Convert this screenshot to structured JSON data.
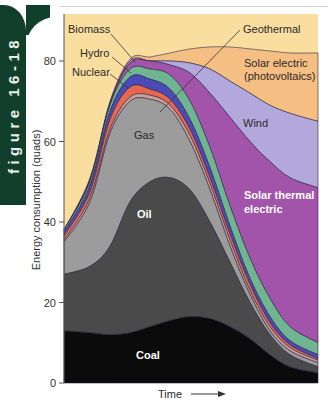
{
  "figure": {
    "tab_label": "figure 16-18"
  },
  "chart_data": {
    "type": "area",
    "title": "",
    "xlabel": "Time",
    "ylabel": "Energy consumption (quads)",
    "ylim": [
      0,
      90
    ],
    "yticks": [
      0,
      20,
      40,
      60,
      80
    ],
    "grid": false,
    "legend_position": "inline labels",
    "x": [
      0,
      1,
      2,
      3,
      4,
      5,
      6,
      7,
      8,
      9,
      10,
      11,
      12
    ],
    "stack_order_bottom_to_top": [
      "Coal",
      "Oil",
      "Gas",
      "Other (thin)",
      "Nuclear",
      "Hydro",
      "Biomass",
      "Solar thermal electric",
      "Wind",
      "Solar electric (photovoltaics)",
      "Geothermal"
    ],
    "series": [
      {
        "name": "Coal",
        "color": "#0b0b0b",
        "values": [
          13,
          12.5,
          12,
          12.5,
          14,
          15.5,
          16.5,
          16,
          14,
          11,
          7,
          4,
          2.5
        ]
      },
      {
        "name": "Oil",
        "color": "#4a4a4a",
        "values": [
          14,
          16.5,
          22,
          32.5,
          36,
          35.5,
          31.5,
          24,
          16,
          9,
          5,
          3,
          1.5
        ]
      },
      {
        "name": "Gas",
        "color": "#9c9c9c",
        "values": [
          8,
          16,
          28,
          25,
          20.5,
          17,
          12,
          8,
          4,
          2,
          1,
          1,
          1
        ]
      },
      {
        "name": "Other (thin)",
        "color": "#c9a09a",
        "values": [
          0.5,
          1,
          1,
          1,
          1,
          1,
          1.5,
          1.5,
          1.5,
          1,
          1,
          0.8,
          0.6
        ]
      },
      {
        "name": "Nuclear",
        "color": "#e8684f",
        "values": [
          1,
          1.5,
          2.5,
          2.5,
          1.5,
          1.5,
          1.5,
          1.5,
          1.5,
          1.5,
          1,
          0.7,
          0.4
        ]
      },
      {
        "name": "Hydro",
        "color": "#4b4bb8",
        "values": [
          1,
          1.5,
          2,
          2.5,
          2.5,
          2.5,
          2.5,
          2.5,
          2,
          1.5,
          1.5,
          1,
          1
        ]
      },
      {
        "name": "Biomass",
        "color": "#6fb592",
        "values": [
          0.5,
          1,
          1.5,
          2,
          2.5,
          3.5,
          4.5,
          5,
          5,
          5,
          4.5,
          3.5,
          3
        ]
      },
      {
        "name": "Solar thermal electric",
        "color": "#a254ab",
        "values": [
          0,
          0.5,
          0.5,
          1.5,
          2,
          2.5,
          7,
          13.5,
          22,
          29,
          34,
          37,
          38.5
        ]
      },
      {
        "name": "Wind",
        "color": "#b3a8dc",
        "values": [
          0,
          0,
          0,
          0.5,
          0,
          1,
          2.5,
          6,
          9,
          12,
          14,
          16,
          16.5
        ]
      },
      {
        "name": "Solar electric (photovoltaics)",
        "color": "#f5be82",
        "values": [
          0,
          0.5,
          0.5,
          0.5,
          1,
          2,
          3.5,
          5.5,
          8.5,
          11,
          13.5,
          15,
          17
        ]
      },
      {
        "name": "Geothermal",
        "color": "#f9dea0",
        "values": [
          52,
          39,
          20,
          9.5,
          9,
          8,
          7,
          6.5,
          6.5,
          7,
          7.5,
          8,
          8
        ]
      }
    ],
    "annotations": [
      "Biomass",
      "Hydro",
      "Nuclear",
      "Geothermal",
      "Solar electric (photovoltaics)",
      "Wind",
      "Gas",
      "Oil",
      "Solar thermal electric",
      "Coal"
    ]
  },
  "labels": {
    "biomass": "Biomass",
    "hydro": "Hydro",
    "nuclear": "Nuclear",
    "geothermal": "Geothermal",
    "solar_electric_1": "Solar electric",
    "solar_electric_2": "(photovoltaics)",
    "wind": "Wind",
    "gas": "Gas",
    "oil": "Oil",
    "solar_thermal_1": "Solar thermal",
    "solar_thermal_2": "electric",
    "coal": "Coal",
    "xlabel": "Time",
    "ylabel": "Energy consumption (quads)",
    "ticks": [
      "0",
      "20",
      "40",
      "60",
      "80"
    ]
  }
}
